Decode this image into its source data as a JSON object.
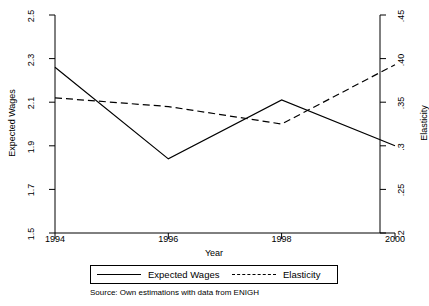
{
  "chart_data": {
    "type": "line",
    "title": "",
    "xlabel": "Year",
    "ylabel": "Expected Wages",
    "y2label": "Elasticity",
    "x": [
      1994,
      1996,
      1998,
      2000
    ],
    "xlim": [
      1994,
      2000
    ],
    "xticks": [
      "1994",
      "1996",
      "1998",
      "2000"
    ],
    "ylim": [
      1.5,
      2.5
    ],
    "yticks": [
      "1.5",
      "1.7",
      "1.9",
      "2.1",
      "2.3",
      "2.5"
    ],
    "y2lim": [
      0.2,
      0.45
    ],
    "y2ticks": [
      ".2",
      ".25",
      ".3",
      ".35",
      ".40",
      ".45"
    ],
    "grid": false,
    "legend_position": "bottom",
    "series": [
      {
        "name": "Expected Wages",
        "axis": "left",
        "style": "solid",
        "color": "#000000",
        "values": [
          2.26,
          1.84,
          2.11,
          1.9
        ]
      },
      {
        "name": "Elasticity",
        "axis": "right",
        "style": "dashed",
        "color": "#000000",
        "values": [
          0.355,
          0.345,
          0.325,
          0.393
        ]
      }
    ],
    "annotations": [
      "Source: Own estimations with data from ENIGH"
    ]
  },
  "axes": {
    "left_title": "Expected Wages",
    "right_title": "Elasticity",
    "x_title": "Year"
  },
  "legend": {
    "items": [
      {
        "label": "Expected Wages",
        "style": "solid"
      },
      {
        "label": "Elasticity",
        "style": "dashed"
      }
    ]
  },
  "note": {
    "source": "Source: Own estimations with data from ENIGH"
  }
}
